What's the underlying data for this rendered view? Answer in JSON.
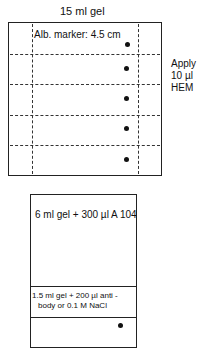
{
  "top_plate": {
    "title": "15 ml gel",
    "marker_label": "Alb. marker: 4.5 cm",
    "side_label": [
      "Apply",
      "10 µl",
      "HEM"
    ],
    "wells": 5
  },
  "bottom_plate": {
    "upper_label": "6 ml gel + 300 µl A 104",
    "middle_label_line1": "1.5 ml gel + 200 µl anti -",
    "middle_label_line2": "body or 0.1 M NaCl"
  }
}
